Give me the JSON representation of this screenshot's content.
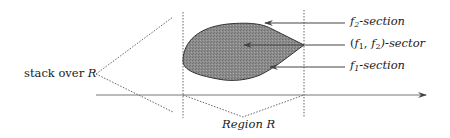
{
  "diagram": {
    "labels": {
      "stack": {
        "text": "stack over ",
        "var": "R"
      },
      "f2_section": {
        "f": "f",
        "sub": "2",
        "rest": "-section"
      },
      "sector": {
        "open": "(",
        "f1": "f",
        "sub1": "1",
        "comma": ", ",
        "f2": "f",
        "sub2": "2",
        "close": ")-sector"
      },
      "f1_section": {
        "f": "f",
        "sub": "1",
        "rest": "-section"
      },
      "region": {
        "text": "Region ",
        "var": "R"
      }
    },
    "colors": {
      "shape_fill": "#8a8a8a",
      "shape_stroke": "#333333",
      "line": "#555555",
      "dotted": "#666666"
    }
  }
}
